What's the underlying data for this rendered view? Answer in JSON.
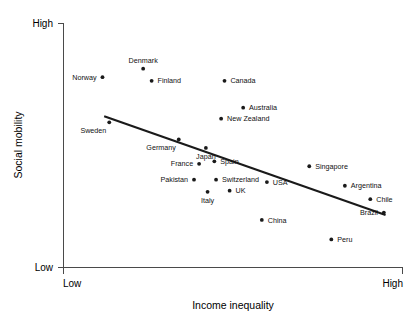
{
  "chart_data": {
    "type": "scatter",
    "title": "",
    "xlabel": "Income inequality",
    "ylabel": "Social mobility",
    "xlim": [
      0,
      100
    ],
    "ylim": [
      0,
      100
    ],
    "grid": false,
    "legend": "none",
    "xtick_labels": [
      "Low",
      "High"
    ],
    "ytick_labels": [
      "Low",
      "High"
    ],
    "axis_low_label": "Low",
    "axis_high_label": "High",
    "points": [
      {
        "name": "Norway",
        "x": 11.5,
        "y": 78.0,
        "label_pos": "left"
      },
      {
        "name": "Denmark",
        "x": 23.5,
        "y": 81.5,
        "label_pos": "above"
      },
      {
        "name": "Finland",
        "x": 26.0,
        "y": 76.5,
        "label_pos": "right"
      },
      {
        "name": "Canada",
        "x": 47.5,
        "y": 76.5,
        "label_pos": "right"
      },
      {
        "name": "Australia",
        "x": 53.0,
        "y": 65.5,
        "label_pos": "right"
      },
      {
        "name": "New Zealand",
        "x": 46.5,
        "y": 61.0,
        "label_pos": "right"
      },
      {
        "name": "Sweden",
        "x": 13.5,
        "y": 59.5,
        "label_pos": "below-left"
      },
      {
        "name": "Germany",
        "x": 34.0,
        "y": 52.5,
        "label_pos": "below-left"
      },
      {
        "name": "Japan",
        "x": 42.0,
        "y": 49.0,
        "label_pos": "below"
      },
      {
        "name": "France",
        "x": 40.0,
        "y": 42.5,
        "label_pos": "left"
      },
      {
        "name": "Spain",
        "x": 44.5,
        "y": 43.5,
        "label_pos": "right"
      },
      {
        "name": "Pakistan",
        "x": 38.5,
        "y": 36.0,
        "label_pos": "left"
      },
      {
        "name": "Switzerland",
        "x": 45.0,
        "y": 36.0,
        "label_pos": "right"
      },
      {
        "name": "Italy",
        "x": 42.5,
        "y": 31.0,
        "label_pos": "below"
      },
      {
        "name": "UK",
        "x": 49.0,
        "y": 31.5,
        "label_pos": "right"
      },
      {
        "name": "USA",
        "x": 60.0,
        "y": 35.0,
        "label_pos": "right"
      },
      {
        "name": "Singapore",
        "x": 72.5,
        "y": 41.5,
        "label_pos": "right"
      },
      {
        "name": "Argentina",
        "x": 83.0,
        "y": 33.5,
        "label_pos": "right"
      },
      {
        "name": "Chile",
        "x": 90.5,
        "y": 28.0,
        "label_pos": "right"
      },
      {
        "name": "Brazil",
        "x": 94.5,
        "y": 22.5,
        "label_pos": "left"
      },
      {
        "name": "China",
        "x": 58.5,
        "y": 19.5,
        "label_pos": "right"
      },
      {
        "name": "Peru",
        "x": 79.0,
        "y": 11.5,
        "label_pos": "right"
      }
    ],
    "trend_line": {
      "x0": 12.0,
      "y0": 62.0,
      "x1": 95.0,
      "y1": 21.5
    }
  }
}
